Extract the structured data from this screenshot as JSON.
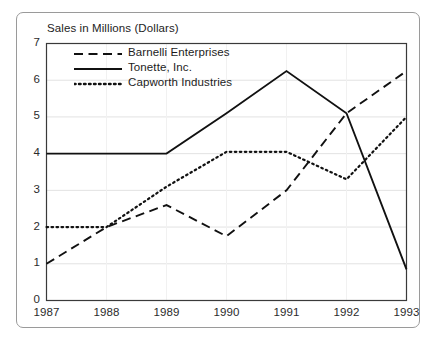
{
  "figure": {
    "axis_title": "Sales in Millions (Dollars)"
  },
  "legend": {
    "position": "inside-top-left",
    "items": [
      {
        "label": "Barnelli Enterprises",
        "style": "dashed",
        "color": "#111111"
      },
      {
        "label": "Tonette, Inc.",
        "style": "solid",
        "color": "#111111"
      },
      {
        "label": "Capworth Industries",
        "style": "dotted",
        "color": "#111111"
      }
    ]
  },
  "axes": {
    "y_ticks": [
      "0",
      "1",
      "2",
      "3",
      "4",
      "5",
      "6",
      "7"
    ],
    "x_ticks": [
      "1987",
      "1988",
      "1989",
      "1990",
      "1991",
      "1992",
      "1993"
    ]
  },
  "chart_data": {
    "type": "line",
    "title": "",
    "xlabel": "",
    "ylabel": "Sales in Millions (Dollars)",
    "categories": [
      "1987",
      "1988",
      "1989",
      "1990",
      "1991",
      "1992",
      "1993"
    ],
    "x": [
      1987,
      1988,
      1989,
      1990,
      1991,
      1992,
      1993
    ],
    "ylim": [
      0,
      7
    ],
    "yticks": [
      0,
      1,
      2,
      3,
      4,
      5,
      6,
      7
    ],
    "grid": true,
    "grid_axis": "y",
    "legend_position": "upper left inside",
    "series": [
      {
        "name": "Barnelli Enterprises",
        "style": "dashed",
        "color": "#111111",
        "values": [
          1.0,
          2.0,
          2.6,
          1.75,
          3.0,
          5.1,
          6.25
        ]
      },
      {
        "name": "Tonette, Inc.",
        "style": "solid",
        "color": "#111111",
        "values": [
          4.0,
          4.0,
          4.0,
          5.1,
          6.25,
          5.1,
          0.85
        ]
      },
      {
        "name": "Capworth Industries",
        "style": "dotted",
        "color": "#111111",
        "values": [
          2.0,
          2.0,
          3.1,
          4.05,
          4.05,
          3.3,
          5.0
        ]
      }
    ]
  },
  "colors": {
    "plot_frame": "#3a3a3a",
    "gridline": "#e2e2e2",
    "outer_frame": "#9a9a9a",
    "text": "#232323"
  }
}
